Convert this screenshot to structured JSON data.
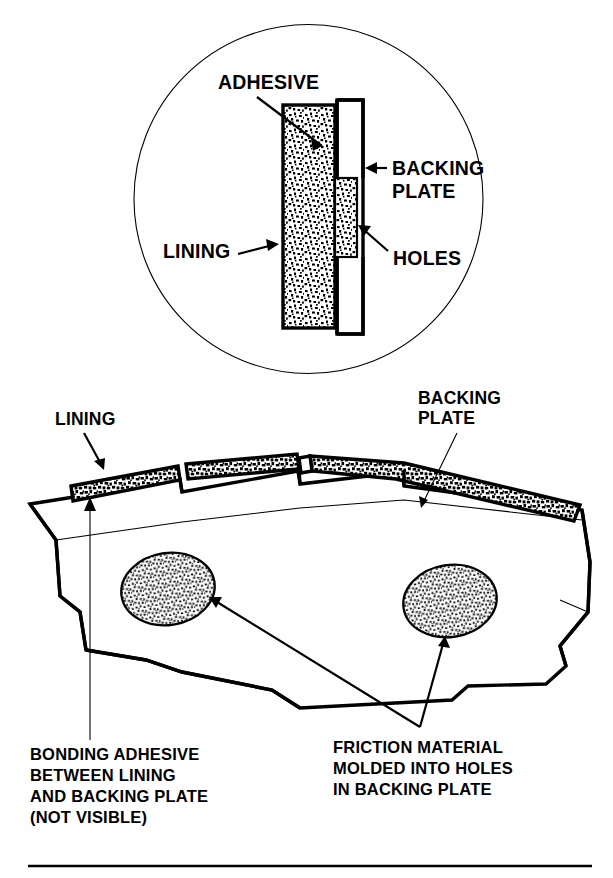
{
  "figure": {
    "ink_color": "#000000",
    "background_color": "#ffffff"
  },
  "detail_view": {
    "name": "cross-section-detail-circle",
    "labels": {
      "adhesive": "ADHESIVE",
      "backing_plate_line1": "BACKING",
      "backing_plate_line2": "PLATE",
      "lining": "LINING",
      "holes": "HOLES"
    }
  },
  "main_view": {
    "name": "brake-pad-perspective",
    "labels": {
      "lining": "LINING",
      "backing_plate_line1": "BACKING",
      "backing_plate_line2": "PLATE"
    }
  },
  "captions": {
    "left": [
      "BONDING ADHESIVE",
      "BETWEEN LINING",
      "AND BACKING PLATE",
      "(NOT VISIBLE)"
    ],
    "right": [
      "FRICTION MATERIAL",
      "MOLDED INTO HOLES",
      "IN BACKING PLATE"
    ]
  }
}
